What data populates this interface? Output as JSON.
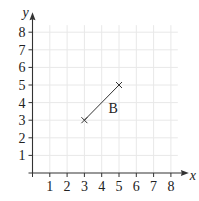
{
  "chart_data": {
    "type": "line",
    "title": "",
    "xlabel": "x",
    "ylabel": "y",
    "xlim": [
      0,
      8.4
    ],
    "ylim": [
      0,
      8.4
    ],
    "x_ticks": [
      1,
      2,
      3,
      4,
      5,
      6,
      7,
      8
    ],
    "y_ticks": [
      1,
      2,
      3,
      4,
      5,
      6,
      7,
      8
    ],
    "grid": true,
    "legend": null,
    "series": [
      {
        "name": "B",
        "label": "B",
        "points": [
          {
            "x": 3,
            "y": 3,
            "marker": "x"
          },
          {
            "x": 5,
            "y": 5,
            "marker": "x"
          }
        ],
        "label_position": {
          "x": 4.4,
          "y": 3.7
        }
      }
    ]
  },
  "axes": {
    "x_label": "x",
    "y_label": "y"
  },
  "segment": {
    "label": "B"
  },
  "colors": {
    "axis": "#333333",
    "grid": "#e8e8e8",
    "line": "#333333"
  }
}
